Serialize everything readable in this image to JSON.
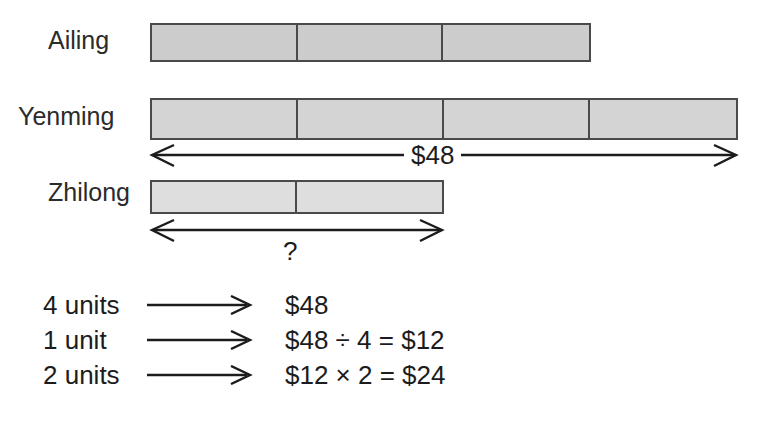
{
  "diagram": {
    "colors": {
      "bar_stroke": "#4a4a4a",
      "fill_ailing": "#cccccc",
      "fill_yenming": "#d4d4d4",
      "fill_zhilong": "#dedede",
      "text": "#1c1c1c",
      "background": "#ffffff"
    },
    "bars": [
      {
        "name": "Ailing",
        "units": 3
      },
      {
        "name": "Yenming",
        "units": 4
      },
      {
        "name": "Zhilong",
        "units": 2
      }
    ],
    "measures": [
      {
        "id": "total",
        "label": "$48",
        "spans": "Yenming",
        "units": 4
      },
      {
        "id": "unknown",
        "label": "?",
        "spans": "Zhilong",
        "units": 2
      }
    ]
  },
  "calculations": {
    "arrow_icon": "right-arrow-icon",
    "rows": [
      {
        "units": "4 units",
        "result": "$48"
      },
      {
        "units": "1 unit",
        "result": "$48 ÷ 4 = $12"
      },
      {
        "units": "2 units",
        "result": "$12 × 2 = $24"
      }
    ]
  }
}
